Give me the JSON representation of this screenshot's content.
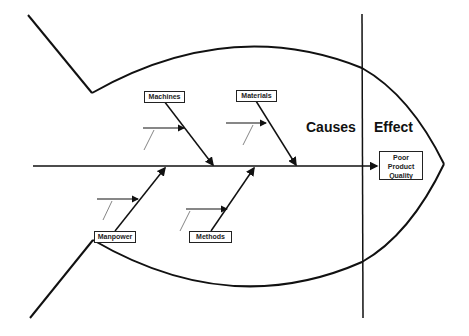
{
  "diagram": {
    "type": "fishbone",
    "sections": {
      "causes": "Causes",
      "effect": "Effect"
    },
    "effect_box": {
      "line1": "Poor",
      "line2": "Product",
      "line3": "Quality"
    },
    "categories": [
      {
        "label": "Machines",
        "position": "top"
      },
      {
        "label": "Materials",
        "position": "top"
      },
      {
        "label": "Manpower",
        "position": "bottom"
      },
      {
        "label": "Methods",
        "position": "bottom"
      }
    ],
    "colors": {
      "line": "#111111",
      "background": "#ffffff"
    }
  }
}
